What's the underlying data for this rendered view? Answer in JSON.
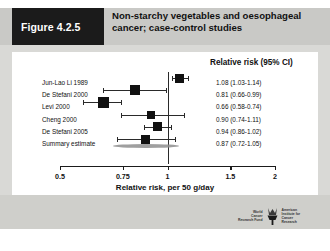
{
  "figure": {
    "tag": "Figure 4.2.5",
    "title": "Non-starchy vegetables and oesophageal cancer; case-control studies"
  },
  "chart_data": {
    "type": "scatter",
    "subtype": "forest-plot",
    "title": "Non-starchy vegetables and oesophageal cancer; case-control studies",
    "xlabel": "Relative risk, per 50 g/day",
    "ylabel": "",
    "value_column_header": "Relative risk (95% CI)",
    "xlim": [
      0.5,
      2
    ],
    "xticks": [
      "0.5",
      "0.75",
      "1",
      "1.5",
      "2"
    ],
    "xtick_values": [
      0.5,
      0.75,
      1,
      1.5,
      2
    ],
    "xscale": "log",
    "null_line": 1,
    "grid": false,
    "legend": "none",
    "categories": [
      "Jun-Lao Li 1989",
      "De Stefani 2000",
      "Levi 2000",
      "Cheng 2000",
      "De Stefani 2005",
      "Summary estimate"
    ],
    "values": [
      1.08,
      0.81,
      0.66,
      0.9,
      0.94,
      0.87
    ],
    "ci_low": [
      1.03,
      0.66,
      0.58,
      0.74,
      0.86,
      0.72
    ],
    "ci_high": [
      1.14,
      0.99,
      0.74,
      1.11,
      1.02,
      1.05
    ],
    "labels": [
      "1.08 (1.03-1.14)",
      "0.81 (0.66-0.99)",
      "0.66 (0.58-0.74)",
      "0.90 (0.74-1.11)",
      "0.94 (0.86-1.02)",
      "0.87 (0.72-1.05)"
    ],
    "is_summary": [
      false,
      false,
      false,
      false,
      false,
      true
    ]
  },
  "footer": {
    "logo_left_line1": "World",
    "logo_left_line2": "Cancer",
    "logo_left_line3": "Research Fund",
    "logo_right_line1": "American",
    "logo_right_line2": "Institute for",
    "logo_right_line3": "Cancer Research"
  }
}
